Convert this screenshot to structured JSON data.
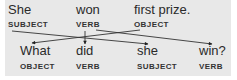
{
  "diagram": {
    "background": "#e8e8e8",
    "text_color": "#2a2a2a",
    "top_row": [
      {
        "word": "She",
        "role": "SUBJECT"
      },
      {
        "word": "won",
        "role": "VERB"
      },
      {
        "word": "first prize.",
        "role": "OBJECT"
      }
    ],
    "bottom_row": [
      {
        "word": "What",
        "role": "OBJECT"
      },
      {
        "word": "did",
        "role": "VERB"
      },
      {
        "word": "she",
        "role": "SUBJECT"
      },
      {
        "word": "win?",
        "role": "VERB"
      }
    ],
    "arrows": [
      {
        "from": "SUBJECT (She)",
        "to": "SUBJECT (she)"
      },
      {
        "from": "VERB (won)",
        "to": "VERB (did)"
      },
      {
        "from": "VERB (won)",
        "to": "VERB (win?)"
      },
      {
        "from": "OBJECT (first prize.)",
        "to": "OBJECT (What)"
      }
    ]
  }
}
